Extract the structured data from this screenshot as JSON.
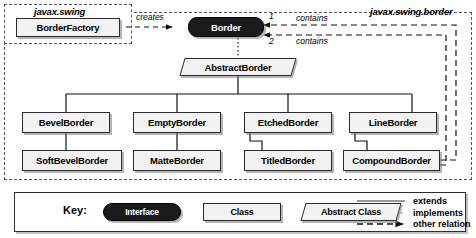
{
  "packages": [
    {
      "name": "javax.swing",
      "label": "javax.swing"
    },
    {
      "name": "javax.swing.border",
      "label": "javax.swing.border"
    }
  ],
  "nodes": {
    "border_factory": {
      "label": "BorderFactory",
      "kind": "class"
    },
    "border": {
      "label": "Border",
      "kind": "interface"
    },
    "abstract_border": {
      "label": "AbstractBorder",
      "kind": "abstract"
    },
    "bevel_border": {
      "label": "BevelBorder",
      "kind": "class"
    },
    "empty_border": {
      "label": "EmptyBorder",
      "kind": "class"
    },
    "etched_border": {
      "label": "EtchedBorder",
      "kind": "class"
    },
    "line_border": {
      "label": "LineBorder",
      "kind": "class"
    },
    "soft_bevel_border": {
      "label": "SoftBevelBorder",
      "kind": "class"
    },
    "matte_border": {
      "label": "MatteBorder",
      "kind": "class"
    },
    "titled_border": {
      "label": "TitledBorder",
      "kind": "class"
    },
    "compound_border": {
      "label": "CompoundBorder",
      "kind": "class"
    }
  },
  "edges": {
    "creates_label": "creates",
    "contains_label_1": "contains",
    "contains_label_2": "contains",
    "multiplicity_1": "1",
    "multiplicity_2": "2"
  },
  "key": {
    "title": "Key:",
    "interface_label": "Interface",
    "class_label": "Class",
    "abstract_label": "Abstract Class",
    "legend": [
      {
        "name": "extends",
        "label": "extends",
        "line": "solid"
      },
      {
        "name": "implements",
        "label": "implements",
        "line": "dotted"
      },
      {
        "name": "other-relation",
        "label": "other relation",
        "line": "dashed-arrow"
      }
    ]
  },
  "colors": {
    "interface_fill": "#1b1b1b",
    "class_fill": "#f2f2f2",
    "stroke": "#2b2b2b",
    "package_stroke": "#555555",
    "background": "#ffffff"
  }
}
